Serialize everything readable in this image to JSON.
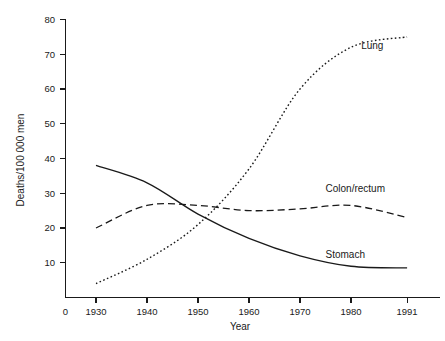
{
  "chart_data": {
    "type": "line",
    "title": "",
    "subtitle": "",
    "xlabel": "Year",
    "ylabel": "Deaths/100 000 men",
    "x": [
      1930,
      1940,
      1950,
      1960,
      1970,
      1980,
      1991
    ],
    "xlim": [
      1925,
      1996
    ],
    "ylim": [
      0,
      80
    ],
    "grid": false,
    "legend_position": "inline-end-labels",
    "x_tick_labels": [
      "0",
      "1930",
      "1940",
      "1950",
      "1960",
      "1970",
      "1980",
      "1991"
    ],
    "x_tick_values": [
      1925,
      1930,
      1940,
      1950,
      1960,
      1970,
      1980,
      1991
    ],
    "y_tick_labels": [
      "10",
      "20",
      "30",
      "40",
      "50",
      "60",
      "70",
      "80"
    ],
    "y_tick_values": [
      10,
      20,
      30,
      40,
      50,
      60,
      70,
      80
    ],
    "series": [
      {
        "name": "Lung",
        "style": "dotted",
        "color": "#1a1a1a",
        "label_anchor": {
          "x": 1982,
          "y": 71.5
        },
        "values": [
          4,
          11,
          21,
          37,
          60,
          72,
          75
        ]
      },
      {
        "name": "Colon/rectum",
        "style": "dashed",
        "color": "#1a1a1a",
        "label_anchor": {
          "x": 1975,
          "y": 30.5
        },
        "values": [
          20,
          26.5,
          26.5,
          25,
          25.5,
          26.5,
          23
        ]
      },
      {
        "name": "Stomach",
        "style": "solid",
        "color": "#1a1a1a",
        "label_anchor": {
          "x": 1975,
          "y": 11.5
        },
        "values": [
          38,
          33,
          24,
          17,
          12,
          9,
          8.5
        ]
      }
    ]
  },
  "axes": {
    "x_axis_label": "Year",
    "y_axis_label": "Deaths/100 000 men",
    "origin_label": "0"
  },
  "colors": {
    "ink": "#1a1a1a",
    "background": "#ffffff"
  }
}
